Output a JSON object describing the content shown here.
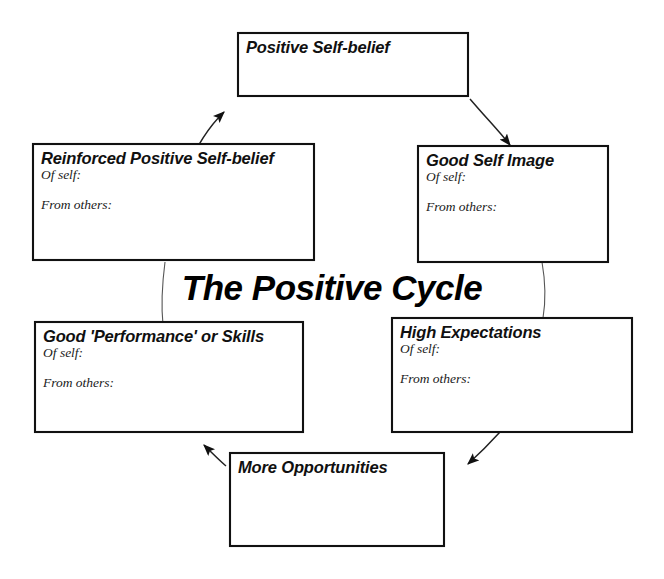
{
  "diagram": {
    "center_title": "The Positive Cycle",
    "direction": "clockwise",
    "sub_labels": {
      "of_self": "Of self:",
      "from_others": "From others:"
    },
    "nodes": [
      {
        "id": "positive-self-belief",
        "title": "Positive Self-belief",
        "has_of_self": false,
        "has_from_others": false
      },
      {
        "id": "good-self-image",
        "title": "Good Self Image",
        "has_of_self": true,
        "has_from_others": true,
        "of_self": "Of self:",
        "from_others": "From others:"
      },
      {
        "id": "high-expectations",
        "title": "High Expectations",
        "has_of_self": true,
        "has_from_others": true,
        "of_self": "Of self:",
        "from_others": "From others:"
      },
      {
        "id": "more-opportunities",
        "title": "More Opportunities",
        "has_of_self": false,
        "has_from_others": false
      },
      {
        "id": "good-performance-or-skills",
        "title": "Good 'Performance' or Skills",
        "has_of_self": true,
        "has_from_others": true,
        "of_self": "Of self:",
        "from_others": "From others:"
      },
      {
        "id": "reinforced-positive-self-belief",
        "title": "Reinforced Positive Self-belief",
        "has_of_self": true,
        "has_from_others": true,
        "of_self": "Of self:",
        "from_others": "From others:"
      }
    ],
    "edges": [
      {
        "from": "positive-self-belief",
        "to": "good-self-image",
        "arrow": true
      },
      {
        "from": "good-self-image",
        "to": "high-expectations",
        "arrow": false
      },
      {
        "from": "high-expectations",
        "to": "more-opportunities",
        "arrow": true
      },
      {
        "from": "more-opportunities",
        "to": "good-performance-or-skills",
        "arrow": true
      },
      {
        "from": "good-performance-or-skills",
        "to": "reinforced-positive-self-belief",
        "arrow": false
      },
      {
        "from": "reinforced-positive-self-belief",
        "to": "positive-self-belief",
        "arrow": true
      }
    ],
    "colors": {
      "background": "#ffffff",
      "box_border": "#111111",
      "text": "#101010",
      "connector": "#222222"
    }
  }
}
